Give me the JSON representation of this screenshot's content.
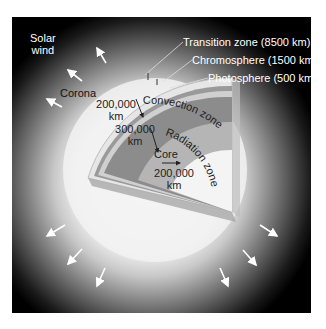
{
  "diagram": {
    "colors": {
      "background": "#000000",
      "sun_glow": "#f2f2f2",
      "convection_zone": "#8c8c8c",
      "radiation_zone": "#b8b8b8",
      "core": "#f4f4f4",
      "photosphere_band": "#d6d6d6",
      "text_light": "#ffffff",
      "text_dark": "#222222"
    },
    "labels": {
      "solar_wind_line1": "Solar",
      "solar_wind_line2": "wind",
      "corona": "Corona",
      "transition_zone": "Transition zone (8500 km)",
      "chromosphere": "Chromosphere (1500 km)",
      "photosphere": "Photosphere (500 km)",
      "convection_zone": "Convection zone",
      "radiation_zone": "Radiation zone",
      "core": "Core",
      "convection_depth_value": "200,000",
      "convection_depth_unit": "km",
      "radiation_depth_value": "300,000",
      "radiation_depth_unit": "km",
      "core_radius_value": "200,000",
      "core_radius_unit": "km"
    },
    "solar_wind_arrows": 9
  }
}
